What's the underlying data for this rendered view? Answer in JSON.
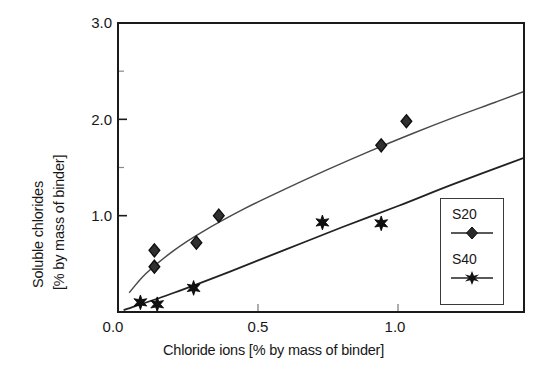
{
  "chart_data": {
    "type": "scatter",
    "title": "",
    "xlabel": "Chloride ions [% by mass of binder]",
    "ylabel_line1": "Soluble chlorides",
    "ylabel_line2": "[% by mass of binder]",
    "xlim": [
      0.0,
      1.45
    ],
    "ylim": [
      0.0,
      3.0
    ],
    "xticks": [
      0.0,
      0.5,
      1.0
    ],
    "xticklabels": [
      "0.0",
      "0.5",
      "1.0"
    ],
    "yticks": [
      1.0,
      2.0,
      3.0
    ],
    "yticklabels": [
      "1.0",
      "2.0",
      "3.0"
    ],
    "yminorticks": [
      1.5,
      2.5
    ],
    "grid": false,
    "legend_position": "right-middle",
    "marker_color": "#1a1a1a",
    "line_color": "#333333",
    "frame_color": "#1a1a1a",
    "series": [
      {
        "name": "S20",
        "marker": "diamond",
        "points": [
          {
            "x": 0.13,
            "y": 0.64
          },
          {
            "x": 0.13,
            "y": 0.47
          },
          {
            "x": 0.28,
            "y": 0.72
          },
          {
            "x": 0.36,
            "y": 1.0
          },
          {
            "x": 0.94,
            "y": 1.73
          },
          {
            "x": 1.03,
            "y": 1.98
          }
        ],
        "fit_curve": [
          {
            "x": 0.04,
            "y": 0.2
          },
          {
            "x": 0.1,
            "y": 0.4
          },
          {
            "x": 0.2,
            "y": 0.64
          },
          {
            "x": 0.3,
            "y": 0.83
          },
          {
            "x": 0.45,
            "y": 1.07
          },
          {
            "x": 0.6,
            "y": 1.28
          },
          {
            "x": 0.75,
            "y": 1.48
          },
          {
            "x": 0.9,
            "y": 1.67
          },
          {
            "x": 1.05,
            "y": 1.85
          },
          {
            "x": 1.2,
            "y": 2.02
          },
          {
            "x": 1.35,
            "y": 2.18
          },
          {
            "x": 1.45,
            "y": 2.29
          }
        ]
      },
      {
        "name": "S40",
        "marker": "star",
        "points": [
          {
            "x": 0.08,
            "y": 0.1
          },
          {
            "x": 0.14,
            "y": 0.08
          },
          {
            "x": 0.27,
            "y": 0.25
          },
          {
            "x": 0.73,
            "y": 0.93
          },
          {
            "x": 0.94,
            "y": 0.92
          }
        ],
        "fit_curve": [
          {
            "x": 0.02,
            "y": 0.02
          },
          {
            "x": 0.2,
            "y": 0.2
          },
          {
            "x": 0.4,
            "y": 0.42
          },
          {
            "x": 0.6,
            "y": 0.65
          },
          {
            "x": 0.8,
            "y": 0.88
          },
          {
            "x": 1.0,
            "y": 1.1
          },
          {
            "x": 1.2,
            "y": 1.33
          },
          {
            "x": 1.45,
            "y": 1.6
          }
        ]
      }
    ],
    "legend": [
      {
        "label": "S20",
        "marker": "diamond"
      },
      {
        "label": "S40",
        "marker": "star"
      }
    ]
  }
}
